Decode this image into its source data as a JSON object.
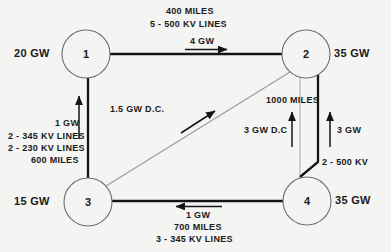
{
  "diagram": {
    "background_color": "#f4f4f2",
    "line_color": "#141414",
    "thin_line_color": "#9a9a9a",
    "nodes": [
      {
        "id": "node-1",
        "number": "1",
        "capacity": "20 GW",
        "cx": 86,
        "cy": 54,
        "r": 24
      },
      {
        "id": "node-2",
        "number": "2",
        "capacity": "35 GW",
        "cx": 306,
        "cy": 54,
        "r": 24
      },
      {
        "id": "node-3",
        "number": "3",
        "capacity": "15 GW",
        "cx": 88,
        "cy": 202,
        "r": 24
      },
      {
        "id": "node-4",
        "number": "4",
        "capacity": "35 GW",
        "cx": 307,
        "cy": 201,
        "r": 24
      }
    ],
    "links": {
      "link_1_2": {
        "distance": "400 MILES",
        "lines": "5 - 500 KV LINES",
        "flow": "4 GW",
        "flow_direction": "right"
      },
      "link_1_3": {
        "flow": "1 GW",
        "flow_direction": "up",
        "lines_a": "2 - 345 KV LINES",
        "lines_b": "2 - 230 KV LINES",
        "distance": "600 MILES"
      },
      "link_3_2": {
        "flow": "1.5 GW D.C.",
        "flow_direction": "up-right"
      },
      "link_4_2_dc": {
        "flow": "3 GW D.C",
        "flow_direction": "up"
      },
      "link_4_2_ac": {
        "distance": "1000 MILES",
        "flow": "3 GW",
        "flow_direction": "up",
        "lines": "2 - 500 KV"
      },
      "link_3_4": {
        "flow": "1 GW",
        "flow_direction": "left",
        "distance": "700 MILES",
        "lines": "3 - 345 KV LINES"
      }
    }
  }
}
